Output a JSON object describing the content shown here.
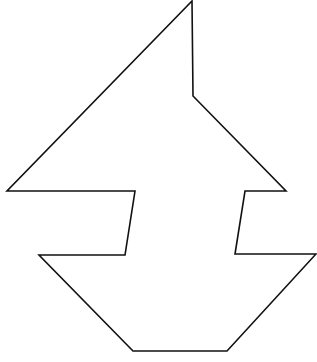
{
  "figure": {
    "type": "silhouette-outline",
    "description": "Tangram-style sailboat silhouette outline",
    "stroke_color": "#111111",
    "fill_color": "#ffffff",
    "background": "#ffffff",
    "stroke_width": 1.6,
    "outline_points": "192,1 193,96 286,191 245,191 235,254 316,254 227,351 133,351 39,255 125,255 135,191 7,191"
  }
}
